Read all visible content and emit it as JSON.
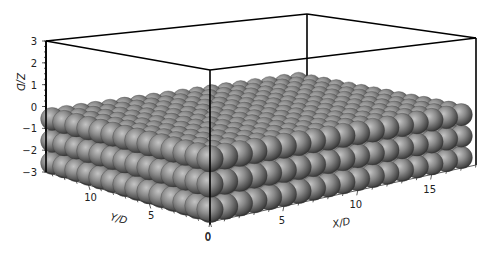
{
  "chart_data": {
    "type": "scatter3d",
    "title": "",
    "xlabel": "X/D",
    "ylabel": "Y/D",
    "zlabel": "Z/D",
    "xlim": [
      0,
      18
    ],
    "ylim": [
      0,
      13.5
    ],
    "zlim": [
      -3,
      3
    ],
    "x_ticks": [
      0,
      5,
      10,
      15
    ],
    "y_ticks": [
      0,
      5,
      10
    ],
    "z_ticks": [
      3,
      2,
      1,
      0,
      -1,
      -2,
      -3
    ],
    "lattice": {
      "nx": 18,
      "ny": 14,
      "layer_z": [
        -0.5,
        -1.5,
        -2.5
      ],
      "sphere_diameter": 1
    },
    "grid": false,
    "legend": "none",
    "colors": {
      "sphere": "#808080",
      "box": "#000000"
    }
  }
}
